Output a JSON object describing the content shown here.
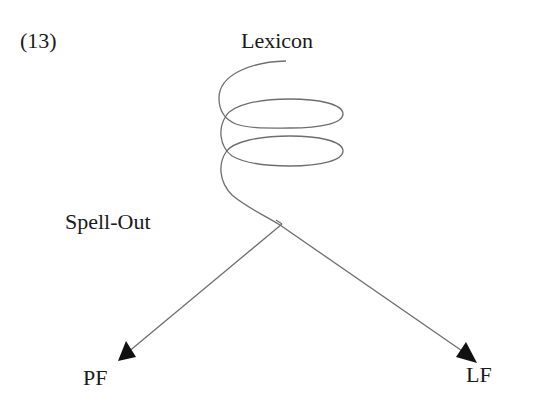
{
  "example_number": "(13)",
  "labels": {
    "top": "Lexicon",
    "branch_point": "Spell-Out",
    "left_leaf": "PF",
    "right_leaf": "LF"
  },
  "colors": {
    "line": "#6e6e6e",
    "arrow": "#111111",
    "text": "#1a1a1a"
  }
}
